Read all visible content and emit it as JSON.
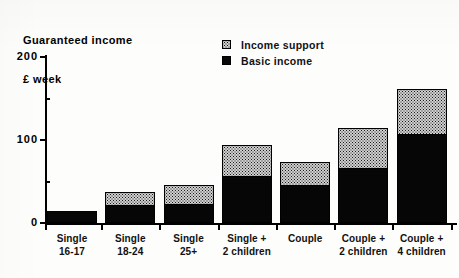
{
  "chart_data": {
    "type": "bar",
    "title": "Guaranteed income",
    "subtitle": "£ week",
    "xlabel": "",
    "ylabel": "",
    "ylim": [
      0,
      200
    ],
    "yticks_major": [
      0,
      100,
      200
    ],
    "ytick_labels": [
      "0",
      "100",
      "200"
    ],
    "yticks_minor": [
      50,
      150
    ],
    "grid": false,
    "stacked": true,
    "legend_position": "top-center-right",
    "categories": [
      "Single\n16-17",
      "Single\n18-24",
      "Single\n25+",
      "Single +\n2 children",
      "Couple",
      "Couple +\n2 children",
      "Couple +\n4 children"
    ],
    "series": [
      {
        "name": "Basic income",
        "color": "#000000",
        "pattern": "solid",
        "values": [
          14,
          22,
          23,
          57,
          46,
          66,
          107
        ]
      },
      {
        "name": "Income support",
        "color": "#cfcfcf",
        "pattern": "dotted-screen",
        "values": [
          0,
          15,
          23,
          37,
          27,
          49,
          55
        ]
      }
    ],
    "totals": [
      14,
      37,
      46,
      94,
      73,
      115,
      162
    ]
  },
  "legend": {
    "items": [
      {
        "label": "Income support",
        "swatch": "support"
      },
      {
        "label": "Basic income",
        "swatch": "basic"
      }
    ]
  }
}
